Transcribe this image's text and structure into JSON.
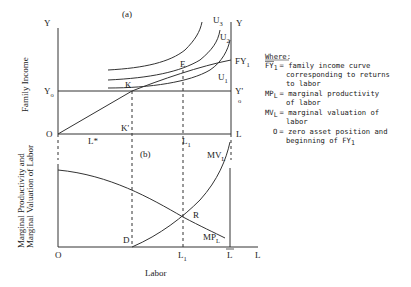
{
  "figure": {
    "panel_a": {
      "tag": "(a)",
      "y_axis_title": "Family Income",
      "labels": {
        "y_left": "Y",
        "y_right": "Y",
        "origin": "O",
        "y0_left": "Y",
        "y0_left_sub": "o",
        "y0_right": "Y'",
        "y0_right_sub": "o",
        "fy1": "FY",
        "fy1_sub": "1",
        "u1": "U",
        "u1_sub": "1",
        "u2": "U",
        "u2_sub": "2",
        "u3": "U",
        "u3_sub": "3",
        "k": "K",
        "k_prime": "K'",
        "e": "E",
        "l_star": "L*",
        "l1_top": "L",
        "l1_top_sub": "1",
        "l_right": "L"
      }
    },
    "panel_b": {
      "tag": "(b)",
      "y_axis_title_line1": "Marginal Productivity and",
      "y_axis_title_line2": "Marginal Valuation of Labor",
      "x_axis_title": "Labor",
      "labels": {
        "origin": "O",
        "mv": "MV",
        "mv_sub": "L",
        "mp": "MP",
        "mp_sub": "L",
        "r": "R",
        "d": "D",
        "l1": "L",
        "l1_sub": "1",
        "l_bar": "L",
        "l_end": "L"
      }
    },
    "legend": {
      "title": "Where:",
      "entries": [
        {
          "symbol": "FY",
          "symbol_sub": "1",
          "lines": [
            "= family income curve",
            "  corresponding to returns",
            "  to labor"
          ]
        },
        {
          "symbol": "MP",
          "symbol_sub": "L",
          "lines": [
            "= marginal productivity",
            "  of labor"
          ]
        },
        {
          "symbol": "MV",
          "symbol_sub": "L",
          "lines": [
            "= marginal valuation of",
            "  labor"
          ]
        },
        {
          "symbol": "O",
          "symbol_sub": "",
          "lines": [
            "= zero asset position and",
            "  beginning of FY"
          ],
          "trailing_sub": "1"
        }
      ]
    }
  }
}
